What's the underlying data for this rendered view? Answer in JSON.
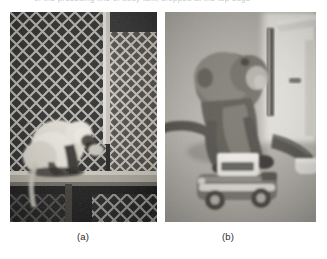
{
  "page": {
    "background_color": "#ffffff",
    "cropped_header_text": "of the preceding line of body text, cropped at the top edge"
  },
  "figure": {
    "panels": [
      {
        "id": "a",
        "caption": "(a)",
        "subject": "monkey behind chain-link fence sitting on a wooden ledge",
        "tone": "grayscale photograph",
        "dominant_colors": {
          "fence_dark": "#2a2a2a",
          "fence_wire": "#d8d8d8",
          "animal_light": "#e4e0d6",
          "ledge": "#b9b4a8",
          "shadow": "#111111"
        }
      },
      {
        "id": "b",
        "caption": "(b)",
        "subject": "monkey crouching over a toy car on a concrete ground",
        "tone": "grayscale photograph",
        "dominant_colors": {
          "ground": "#b8b5ae",
          "wall": "#e9e7e1",
          "animal": "#6d6a62",
          "toy_car_body": "#7a7770",
          "toy_car_highlight": "#efece6",
          "pipe": "#555249"
        }
      }
    ]
  }
}
